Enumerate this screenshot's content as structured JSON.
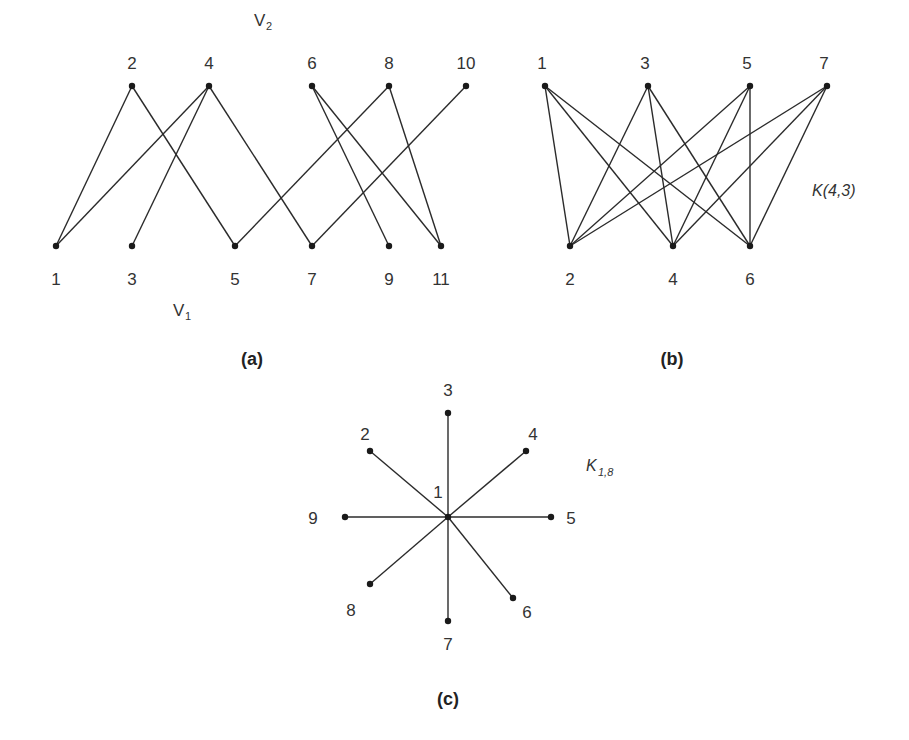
{
  "figures": [
    {
      "id": "a",
      "caption": "(a)",
      "set_labels": [
        {
          "main": "V",
          "sub": "2"
        },
        {
          "main": "V",
          "sub": "1"
        }
      ],
      "top_vertices": [
        "2",
        "4",
        "6",
        "8",
        "10"
      ],
      "bottom_vertices": [
        "1",
        "3",
        "5",
        "7",
        "9",
        "11"
      ],
      "edges": [
        [
          "1",
          "2"
        ],
        [
          "1",
          "4"
        ],
        [
          "3",
          "4"
        ],
        [
          "5",
          "2"
        ],
        [
          "7",
          "4"
        ],
        [
          "5",
          "8"
        ],
        [
          "7",
          "10"
        ],
        [
          "9",
          "6"
        ],
        [
          "11",
          "6"
        ],
        [
          "11",
          "8"
        ]
      ]
    },
    {
      "id": "b",
      "caption": "(b)",
      "name": "K(4,3)",
      "top_vertices": [
        "1",
        "3",
        "5",
        "7"
      ],
      "bottom_vertices": [
        "2",
        "4",
        "6"
      ],
      "edges": "complete"
    },
    {
      "id": "c",
      "caption": "(c)",
      "name": {
        "main": "K",
        "sub": "1,8"
      },
      "center": "1",
      "leaves": [
        "3",
        "4",
        "5",
        "6",
        "7",
        "8",
        "9",
        "2"
      ]
    }
  ]
}
